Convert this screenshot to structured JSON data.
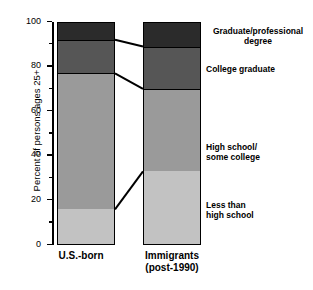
{
  "chart_data": {
    "type": "bar",
    "stacked": true,
    "title": "",
    "xlabel": "",
    "ylabel": "Percent of persons ages 25+",
    "ylim": [
      0,
      100
    ],
    "ytick_values": [
      0,
      20,
      40,
      60,
      80,
      100
    ],
    "ytick_labels": [
      "0",
      "20",
      "40",
      "60",
      "80",
      "100"
    ],
    "yminor_ticks": [
      10,
      30,
      50,
      70,
      90
    ],
    "grid": false,
    "legend_position": "right-inline",
    "categories": [
      "U.S.-born",
      "Immigrants (post-1990)"
    ],
    "category_lines": [
      [
        "U.S.-born"
      ],
      [
        "Immigrants",
        "(post-1990)"
      ]
    ],
    "series": [
      {
        "name": "Less than high school",
        "color": "#c2c2c2",
        "values": [
          16,
          33
        ],
        "legend_lines": [
          "Less than",
          "high school"
        ]
      },
      {
        "name": "High school/some college",
        "color": "#9a9a9a",
        "values": [
          61,
          37
        ],
        "legend_lines": [
          "High school/",
          "some college"
        ]
      },
      {
        "name": "College graduate",
        "color": "#565656",
        "values": [
          15,
          19
        ],
        "legend_lines": [
          "College graduate"
        ]
      },
      {
        "name": "Graduate/professional degree",
        "color": "#2b2b2b",
        "values": [
          8,
          11
        ],
        "legend_lines": [
          "Graduate/professional",
          "degree"
        ]
      }
    ],
    "cumulative_boundaries": [
      [
        16,
        77,
        92
      ],
      [
        33,
        70,
        89
      ]
    ],
    "connector_lines": true,
    "axis_color": "#000000",
    "background": "#ffffff"
  },
  "axis": {
    "y_title": "Percent of persons ages 25+"
  },
  "legend": {
    "graduate_professional": "Graduate/professional",
    "degree": "degree",
    "college_graduate": "College graduate",
    "high_school": "High school/",
    "some_college": "some college",
    "less_than": "Less than",
    "high_school_2": "high school"
  },
  "categories": {
    "cat0_line0": "U.S.-born",
    "cat1_line0": "Immigrants",
    "cat1_line1": "(post-1990)"
  },
  "ticks": {
    "t0": "0",
    "t20": "20",
    "t40": "40",
    "t60": "60",
    "t80": "80",
    "t100": "100"
  }
}
